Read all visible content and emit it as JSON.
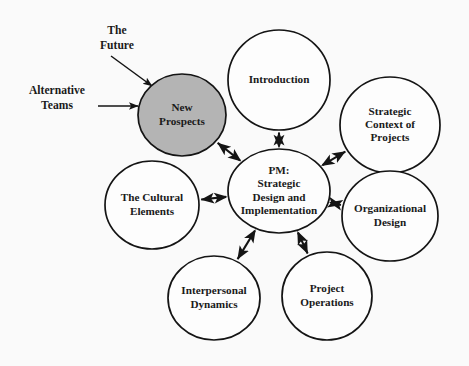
{
  "diagram": {
    "background_color": "#fafafa",
    "highlight_color": "#b4b4b4",
    "stroke_color": "#141414",
    "center_node": {
      "id": "pm-strategic-design",
      "lines": [
        "PM:",
        "Strategic",
        "Design and",
        "Implementation"
      ],
      "cx": 279,
      "cy": 191,
      "rx": 51,
      "ry": 42,
      "fill": "#fdfdfd"
    },
    "nodes": [
      {
        "id": "new-prospects",
        "lines": [
          "New",
          "Prospects"
        ],
        "cx": 182,
        "cy": 115,
        "rx": 44,
        "ry": 41,
        "fill": "#b4b4b4",
        "highlighted": true
      },
      {
        "id": "introduction",
        "lines": [
          "Introduction"
        ],
        "cx": 279,
        "cy": 80,
        "rx": 51,
        "ry": 50,
        "fill": "#fdfdfd",
        "highlighted": false
      },
      {
        "id": "strategic-context-of-projects",
        "lines": [
          "Strategic",
          "Context of",
          "Projects"
        ],
        "cx": 390,
        "cy": 125,
        "rx": 50,
        "ry": 48,
        "fill": "#fdfdfd",
        "highlighted": false
      },
      {
        "id": "organizational-design",
        "lines": [
          "Organizational",
          "Design"
        ],
        "cx": 390,
        "cy": 216,
        "rx": 48,
        "ry": 45,
        "fill": "#fdfdfd",
        "highlighted": false
      },
      {
        "id": "project-operations",
        "lines": [
          "Project",
          "Operations"
        ],
        "cx": 327,
        "cy": 296,
        "rx": 45,
        "ry": 44,
        "fill": "#fdfdfd",
        "highlighted": false
      },
      {
        "id": "interpersonal-dynamics",
        "lines": [
          "Interpersonal",
          "Dynamics"
        ],
        "cx": 214,
        "cy": 298,
        "rx": 46,
        "ry": 42,
        "fill": "#fdfdfd",
        "highlighted": false
      },
      {
        "id": "the-cultural-elements",
        "lines": [
          "The Cultural",
          "Elements"
        ],
        "cx": 152,
        "cy": 205,
        "rx": 47,
        "ry": 44,
        "fill": "#fdfdfd",
        "highlighted": false
      }
    ],
    "connectors": [
      {
        "id": "connector-new-prospects",
        "from": "pm-strategic-design",
        "to": "new-prospects",
        "style": "double-arrow"
      },
      {
        "id": "connector-introduction",
        "from": "pm-strategic-design",
        "to": "introduction",
        "style": "double-arrow"
      },
      {
        "id": "connector-strategic-context",
        "from": "pm-strategic-design",
        "to": "strategic-context-of-projects",
        "style": "double-arrow"
      },
      {
        "id": "connector-organizational-design",
        "from": "pm-strategic-design",
        "to": "organizational-design",
        "style": "double-arrow"
      },
      {
        "id": "connector-project-operations",
        "from": "pm-strategic-design",
        "to": "project-operations",
        "style": "double-arrow"
      },
      {
        "id": "connector-interpersonal-dynamics",
        "from": "pm-strategic-design",
        "to": "interpersonal-dynamics",
        "style": "double-arrow"
      },
      {
        "id": "connector-cultural-elements",
        "from": "pm-strategic-design",
        "to": "the-cultural-elements",
        "style": "double-arrow"
      }
    ],
    "annotations": [
      {
        "id": "the-future",
        "lines": [
          "The",
          "Future"
        ],
        "text_x": 117,
        "text_y": 31,
        "arrow_from_x": 111,
        "arrow_from_y": 56,
        "arrow_to_x": 152,
        "arrow_to_y": 86,
        "target": "new-prospects",
        "style": "single-arrow"
      },
      {
        "id": "alternative-teams",
        "lines": [
          "Alternative",
          "Teams"
        ],
        "text_x": 57,
        "text_y": 91,
        "arrow_from_x": 98,
        "arrow_from_y": 106,
        "arrow_to_x": 138,
        "arrow_to_y": 106,
        "target": "new-prospects",
        "style": "single-arrow"
      }
    ]
  }
}
